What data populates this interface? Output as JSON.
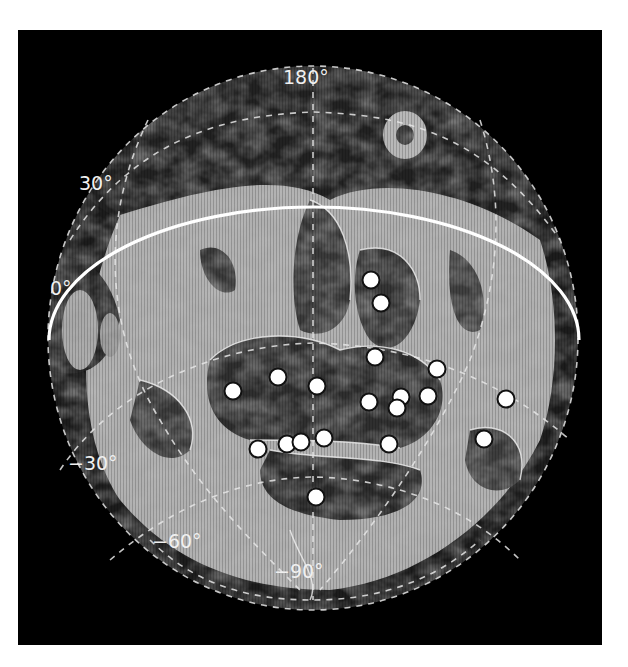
{
  "figure": {
    "projection": "orthographic globe map",
    "background_color": "#000000",
    "page_color": "#ffffff",
    "palette": {
      "near_black": "#0a0a0a",
      "dark_gray": "#2a2a2a",
      "mid_gray": "#595959",
      "light_gray": "#b4b4b4",
      "ridge_white": "#f2f2f2",
      "marker_fill": "#ffffff",
      "marker_stroke": "#111111"
    },
    "labels": {
      "meridian_top": "180°",
      "lat_30": "30°",
      "lat_0": "0°",
      "lat_minus_30": "−30°",
      "lat_minus_60": "−60°",
      "lat_minus_90": "−90°"
    },
    "markers": [
      {
        "x": 371,
        "y": 280
      },
      {
        "x": 381,
        "y": 303
      },
      {
        "x": 375,
        "y": 357
      },
      {
        "x": 437,
        "y": 369
      },
      {
        "x": 233,
        "y": 391
      },
      {
        "x": 278,
        "y": 377
      },
      {
        "x": 317,
        "y": 386
      },
      {
        "x": 369,
        "y": 402
      },
      {
        "x": 401,
        "y": 397
      },
      {
        "x": 397,
        "y": 408
      },
      {
        "x": 428,
        "y": 396
      },
      {
        "x": 506,
        "y": 399
      },
      {
        "x": 258,
        "y": 449
      },
      {
        "x": 287,
        "y": 444
      },
      {
        "x": 301,
        "y": 442
      },
      {
        "x": 324,
        "y": 438
      },
      {
        "x": 389,
        "y": 444
      },
      {
        "x": 484,
        "y": 439
      },
      {
        "x": 316,
        "y": 497
      }
    ],
    "marker_count": 19
  }
}
